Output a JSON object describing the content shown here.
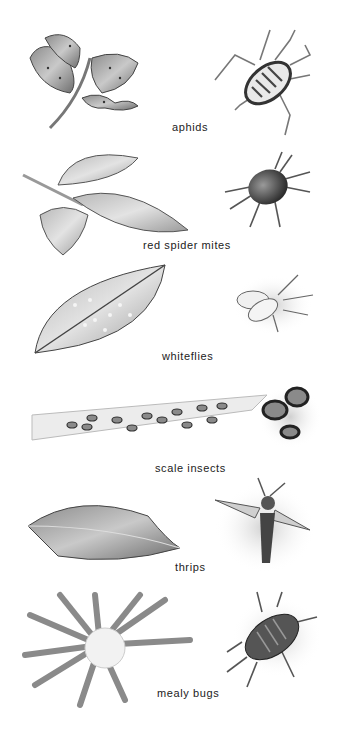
{
  "pests": [
    {
      "name": "aphids",
      "plant": "rose-shoot-with-aphids",
      "insect": "aphid"
    },
    {
      "name": "red spider mites",
      "plant": "mottled-rose-leaves",
      "insect": "spider-mite"
    },
    {
      "name": "whiteflies",
      "plant": "leaf-with-whitefly-colonies",
      "insect": "whitefly"
    },
    {
      "name": "scale insects",
      "plant": "stem-with-scales",
      "insect": "scale"
    },
    {
      "name": "thrips",
      "plant": "silvered-leaf",
      "insect": "thrips"
    },
    {
      "name": "mealy bugs",
      "plant": "cactus-rosette-with-mealy-wool",
      "insect": "mealy-bug"
    }
  ]
}
